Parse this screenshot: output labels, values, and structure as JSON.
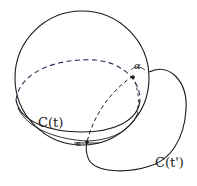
{
  "diagram": {
    "type": "sphere-with-curves",
    "colors": {
      "stroke": "#1a1a1a",
      "dashed_back": "#2a2a55",
      "background": "#ffffff"
    },
    "labels": {
      "curve_on_sphere": "C(t)",
      "curve_off_sphere": "C(t')",
      "angle_top": "α",
      "angle_bottom": "κ"
    }
  }
}
